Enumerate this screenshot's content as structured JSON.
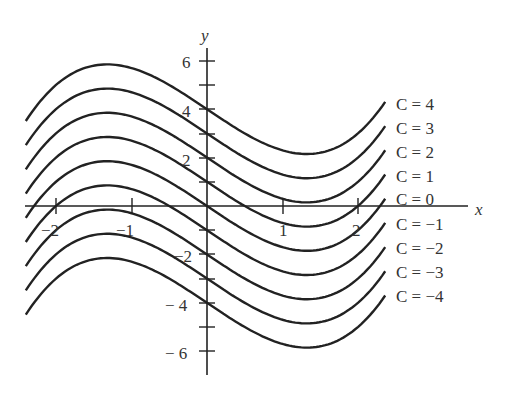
{
  "chart_data": {
    "type": "line",
    "title": "",
    "xlabel": "x",
    "ylabel": "y",
    "xlim": [
      -2.4,
      2.36
    ],
    "ylim": [
      -6.2,
      6.4
    ],
    "grid": false,
    "legend_position": "right (inline labels at curve ends)",
    "x_ticks": [
      -2,
      -1,
      1,
      2
    ],
    "x_tick_labels": [
      "−2",
      "−1",
      "1",
      "2"
    ],
    "y_ticks": [
      -6,
      -5,
      -4,
      -3,
      -2,
      -1,
      1,
      2,
      3,
      4,
      5,
      6
    ],
    "y_tick_labels": [
      "−6",
      "",
      "−4",
      "",
      "−2",
      "",
      "",
      "2",
      "",
      "4",
      "",
      "6"
    ],
    "family_description": "Family of vertically shifted curves y = f(x) + C",
    "base_curve_samples": {
      "x": [
        -2.4,
        -2.0,
        -1.6,
        -1.32,
        -1.0,
        -0.5,
        0,
        0.5,
        1.0,
        1.32,
        1.6,
        2.0,
        2.36
      ],
      "y": [
        -0.49,
        1.0,
        1.72,
        1.85,
        1.7,
        1.0,
        0,
        -1.0,
        -1.7,
        -1.85,
        -1.72,
        -1.0,
        0.3
      ]
    },
    "series": [
      {
        "name": "C = 4",
        "C": 4
      },
      {
        "name": "C = 3",
        "C": 3
      },
      {
        "name": "C = 2",
        "C": 2
      },
      {
        "name": "C = 1",
        "C": 1
      },
      {
        "name": "C = 0",
        "C": 0
      },
      {
        "name": "C = −1",
        "C": -1
      },
      {
        "name": "C = −2",
        "C": -2
      },
      {
        "name": "C = −3",
        "C": -3
      },
      {
        "name": "C = −4",
        "C": -4
      }
    ]
  },
  "axes": {
    "x_label": "x",
    "y_label": "y",
    "x_tick_labels": [
      "−2",
      "−1",
      "1",
      "2"
    ],
    "y_tick_labels": {
      "p6": "6",
      "p4": "4",
      "p2": "2",
      "n2": "−2",
      "n4": "− 4",
      "n6": "− 6"
    }
  },
  "curve_labels": [
    "C = 4",
    "C = 3",
    "C = 2",
    "C = 1",
    "C = 0",
    "C = −1",
    "C = −2",
    "C = −3",
    "C = −4"
  ],
  "colors": {
    "curve": "#222222",
    "axis": "#222222",
    "text": "#333333"
  }
}
